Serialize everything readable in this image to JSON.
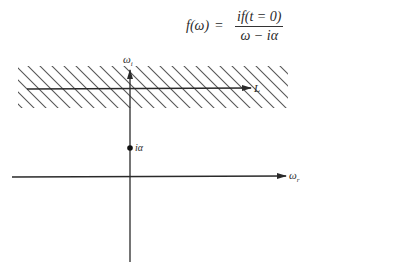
{
  "formula": {
    "lhs": "f(ω)",
    "equals": "=",
    "numerator": "if(t = 0)",
    "denominator": "ω − iα"
  },
  "diagram": {
    "imag_axis_label": "ω",
    "imag_axis_sub": "i",
    "real_axis_label": "ω",
    "real_axis_sub": "r",
    "contour_label": "L",
    "pole_label": "iα",
    "hatched_region": "upper strip (region of analyticity)",
    "colors": {
      "ink": "#2a2a2a",
      "hatch": "#555555"
    }
  }
}
